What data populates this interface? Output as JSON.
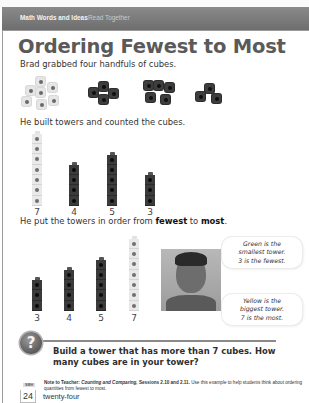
{
  "header": {
    "section": "Math Words and Ideas",
    "subsection": "Read Together"
  },
  "title": "Ordering Fewest to Most",
  "intro": "Brad grabbed four handfuls of cubes.",
  "handfuls": [
    {
      "color": "yellow",
      "count": 7
    },
    {
      "color": "dark",
      "count": 4
    },
    {
      "color": "dark",
      "count": 5
    },
    {
      "color": "dark",
      "count": 3
    }
  ],
  "built_text": "He built towers and counted the cubes.",
  "unordered_towers": [
    {
      "color": "yellow",
      "count": 7,
      "label": "7"
    },
    {
      "color": "dark",
      "count": 4,
      "label": "4"
    },
    {
      "color": "dark",
      "count": 5,
      "label": "5"
    },
    {
      "color": "green",
      "count": 3,
      "label": "3"
    }
  ],
  "ordered_text": {
    "prefix": "He put the towers in order from ",
    "fewest": "fewest",
    "middle": " to ",
    "most": "most",
    "suffix": "."
  },
  "ordered_towers": [
    {
      "color": "green",
      "count": 3,
      "label": "3"
    },
    {
      "color": "dark",
      "count": 4,
      "label": "4"
    },
    {
      "color": "dark",
      "count": 5,
      "label": "5"
    },
    {
      "color": "yellow",
      "count": 7,
      "label": "7"
    }
  ],
  "bubbles": {
    "top": [
      "Green is the",
      "smallest tower.",
      "3 is the fewest."
    ],
    "bottom": [
      "Yellow is the",
      "biggest tower.",
      "7 is the most."
    ]
  },
  "question": {
    "icon": "question-mark-icon",
    "symbol": "?",
    "text": "Build a tower that has more than 7 cubes. How many cubes are in your tower?"
  },
  "note": {
    "label": "Note to Teacher:",
    "title": "Counting and Comparing,",
    "sessions": "Sessions 2.10 and 2.11.",
    "body": "Use this example to help students think about ordering quantities from fewest to most."
  },
  "footer": {
    "badge": "SMH",
    "page_number": "24",
    "page_word": "twenty-four"
  }
}
